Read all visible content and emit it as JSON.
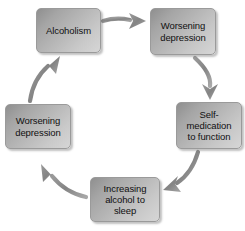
{
  "diagram": {
    "type": "cycle-flow-diagram",
    "background_color": "#ffffff",
    "node_fill_dark": "#8f8f8f",
    "node_fill_light": "#d6d6d6",
    "node_border_color": "#9a9a9a",
    "arrow_color": "#8a8a8a",
    "text_color": "#101010",
    "nodes": [
      {
        "id": "alcoholism",
        "label": "Alcoholism",
        "position": "top-left"
      },
      {
        "id": "worsening_1",
        "label": "Worsening\ndepression",
        "position": "top-right"
      },
      {
        "id": "selfmed",
        "label": "Self-\nmedication\nto function",
        "position": "right"
      },
      {
        "id": "increasing",
        "label": "Increasing\nalcohol to\nsleep",
        "position": "bottom"
      },
      {
        "id": "worsening_2",
        "label": "Worsening\ndepression",
        "position": "left"
      }
    ],
    "edges": [
      {
        "id": "edge-1",
        "from": "alcoholism",
        "to": "worsening_1",
        "shape": "straight-right"
      },
      {
        "id": "edge-2",
        "from": "worsening_1",
        "to": "selfmed",
        "shape": "curve-down-right"
      },
      {
        "id": "edge-3",
        "from": "selfmed",
        "to": "increasing",
        "shape": "curve-down-left"
      },
      {
        "id": "edge-4",
        "from": "increasing",
        "to": "worsening_2",
        "shape": "curve-up-left"
      },
      {
        "id": "edge-5",
        "from": "worsening_2",
        "to": "alcoholism",
        "shape": "curve-up-right"
      }
    ]
  }
}
